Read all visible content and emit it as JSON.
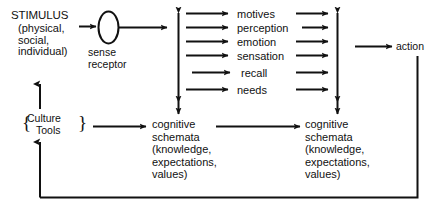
{
  "diagram": {
    "stroke_color": "#111111",
    "background_color": "#ffffff"
  },
  "stimulus": {
    "heading": "STIMULUS",
    "qualifiers": "(physical,\nsocial,\nindividual)"
  },
  "sense_receptor": {
    "label": "sense\nreceptor",
    "shape": "ellipse"
  },
  "processes": {
    "items": [
      {
        "label": "motives"
      },
      {
        "label": "perception"
      },
      {
        "label": "emotion"
      },
      {
        "label": "sensation"
      },
      {
        "label": "recall"
      },
      {
        "label": "needs"
      }
    ]
  },
  "action": {
    "label": "action"
  },
  "culture": {
    "line1": "Culture",
    "line2": "Tools",
    "brace_left": "{",
    "brace_right": "}"
  },
  "schemata": {
    "first": {
      "text": "cognitive\nschemata\n(knowledge,\nexpectations,\nvalues)"
    },
    "second": {
      "text": "cognitive\nschemata\n(knowledge,\nexpectations,\nvalues)"
    }
  },
  "connectors": {
    "stimulus_to_receptor": "arrow-right",
    "receptor_to_processes": "arrow-right",
    "processes_in": "arrow-right",
    "processes_out": "arrow-right",
    "left_vertical_double": "double-headed-arrow",
    "right_vertical_double": "double-headed-arrow",
    "culture_to_schemata": "arrow-right",
    "schemata_to_schemata": "arrow-right",
    "to_action": "arrow-right",
    "feedback_to_culture": "arrow-up",
    "culture_to_stimulus": "arrow-up",
    "action_feedback_loop": "line"
  }
}
